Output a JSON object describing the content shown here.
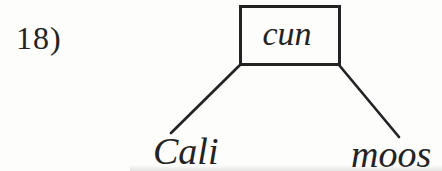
{
  "figure": {
    "problem_number": "18)",
    "root_label": "cun",
    "leaves": [
      {
        "label": "Cali"
      },
      {
        "label": "moos"
      }
    ]
  },
  "icons": {
    "root_box": "rectangle-node",
    "edges": [
      "branch-line-left",
      "branch-line-right"
    ]
  },
  "colors": {
    "ink": "#232323",
    "paper": "#fdfdfc"
  }
}
